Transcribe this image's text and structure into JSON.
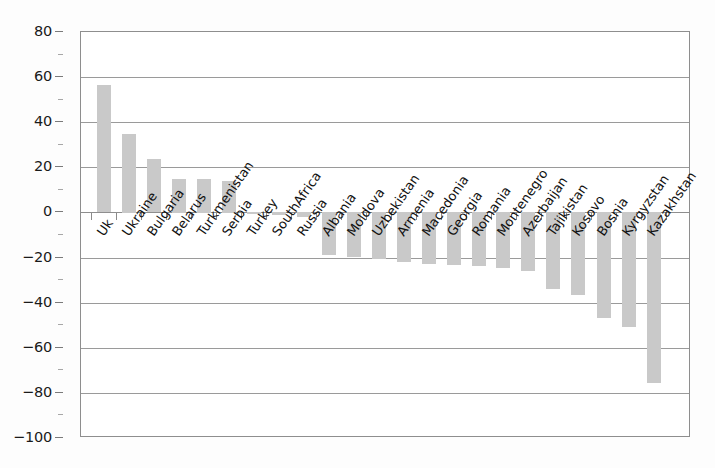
{
  "chart_data": {
    "type": "bar",
    "title": "",
    "subtitle": "",
    "xlabel": "",
    "ylabel": "",
    "ylim": [
      -100,
      80
    ],
    "yticks": [
      80,
      60,
      40,
      20,
      0,
      -20,
      -40,
      -60,
      -80,
      -100
    ],
    "ytick_labels": [
      "80",
      "60",
      "40",
      "20",
      "0",
      "−20",
      "−40",
      "−60",
      "−80",
      "−100"
    ],
    "grid": true,
    "legend": false,
    "bar_color": "#c9c9c9",
    "axis_color": "#8e8e8e",
    "gridline_color": "#9a9a9a",
    "categories": [
      "Uk",
      "Ukraine",
      "Bulgaria",
      "Belarus",
      "Turkmenistan",
      "Serbia",
      "Turkey",
      "SouthAfrica",
      "Russia",
      "Albania",
      "Moldova",
      "Uzbekistan",
      "Armenia",
      "Macedonia",
      "Georgia",
      "Romania",
      "Montenegro",
      "Azerbaijan",
      "Tajikistan",
      "Kosovo",
      "Bosnia",
      "Kyrgyzstan",
      "Kazakhstan"
    ],
    "values": [
      56.5,
      35,
      23.5,
      15,
      15,
      14,
      -1,
      -1.5,
      -2,
      -19,
      -20,
      -21,
      -22,
      -23,
      -23.5,
      -24,
      -25,
      -26,
      -34,
      -37,
      -47,
      -51,
      -76
    ],
    "extra_note": "Kazakhstan ≈ −87"
  },
  "axis": {
    "y_labels": [
      "80",
      "60",
      "40",
      "20",
      "0",
      "−20",
      "−40",
      "−60",
      "−80",
      "−100"
    ]
  }
}
